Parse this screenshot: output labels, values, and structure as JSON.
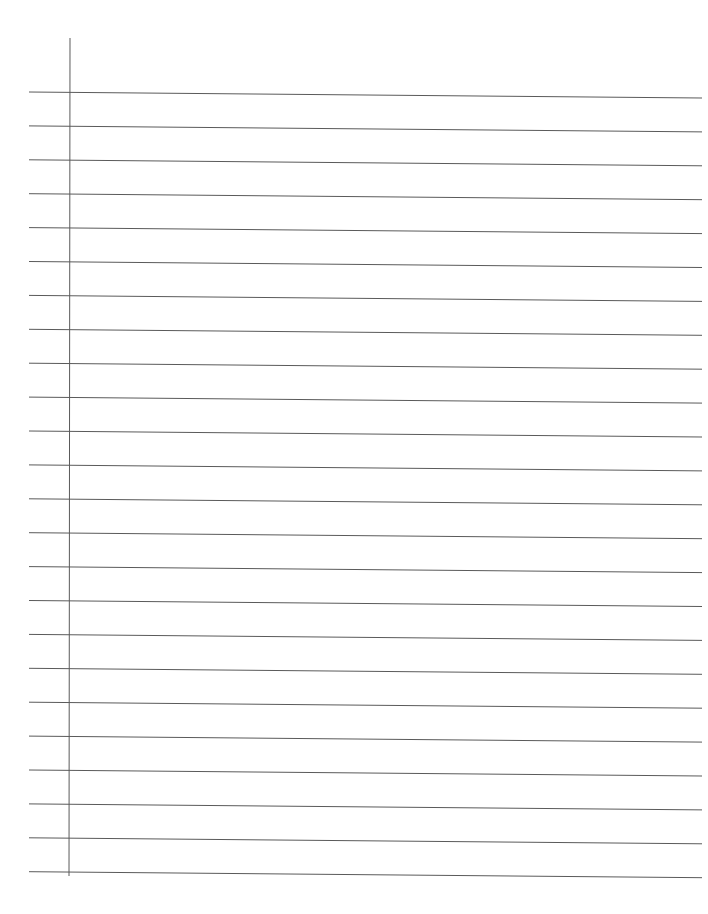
{
  "document": {
    "type": "lined-paper",
    "background": "#ffffff",
    "line_color": "#5a5a5a",
    "margin_line": {
      "x": 70,
      "y_start": 38,
      "y_end": 876
    },
    "rules": {
      "count": 24,
      "x_start": 29,
      "x_end": 702,
      "first_y": 92,
      "spacing": 33.9,
      "right_drop": 6
    }
  }
}
